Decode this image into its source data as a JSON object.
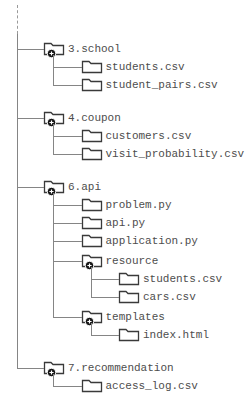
{
  "diagram": {
    "kind": "file-tree",
    "expand_symbol": "+",
    "colors": {
      "background": "#ffffff",
      "line": "#858585",
      "dashed_line": "#9a9a9a",
      "text": "#4d4d4d",
      "folder_outline": "#3a3a3a",
      "folder_fill": "#ffffff",
      "badge_fill": "#161616",
      "badge_symbol_color": "#ffffff"
    }
  },
  "tree": {
    "items": [
      {
        "label": "3.school",
        "type": "folder",
        "expanded": true,
        "children": [
          {
            "label": "students.csv",
            "type": "file"
          },
          {
            "label": "student_pairs.csv",
            "type": "file"
          }
        ]
      },
      {
        "label": "4.coupon",
        "type": "folder",
        "expanded": true,
        "children": [
          {
            "label": "customers.csv",
            "type": "file"
          },
          {
            "label": "visit_probability.csv",
            "type": "file"
          }
        ]
      },
      {
        "label": "6.api",
        "type": "folder",
        "expanded": true,
        "children": [
          {
            "label": "problem.py",
            "type": "file"
          },
          {
            "label": "api.py",
            "type": "file"
          },
          {
            "label": "application.py",
            "type": "file"
          },
          {
            "label": "resource",
            "type": "folder",
            "expanded": true,
            "children": [
              {
                "label": "students.csv",
                "type": "file"
              },
              {
                "label": "cars.csv",
                "type": "file"
              }
            ]
          },
          {
            "label": "templates",
            "type": "folder",
            "expanded": true,
            "children": [
              {
                "label": "index.html",
                "type": "file"
              }
            ]
          }
        ]
      },
      {
        "label": "7.recommendation",
        "type": "folder",
        "expanded": true,
        "children": [
          {
            "label": "access_log.csv",
            "type": "file"
          }
        ]
      }
    ]
  }
}
